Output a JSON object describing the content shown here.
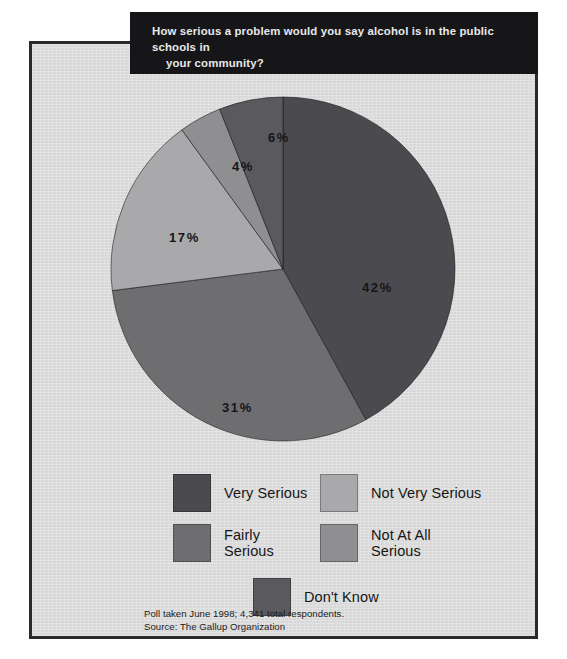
{
  "title": {
    "line1": "How serious a problem would you say alcohol is in the public schools in",
    "line2": "your community?",
    "full": "How serious a problem would you say alcohol is in the public schools in your community?"
  },
  "footnote": {
    "line1": "Poll taken June 1998; 4,341 total respondents.",
    "line2": "Source: The Gallup Organization"
  },
  "legend": [
    {
      "label": "Very Serious",
      "color": "#4b4b4f"
    },
    {
      "label": "Fairly\nSerious",
      "color": "#6e6e71"
    },
    {
      "label": "Not Very Serious",
      "color": "#a9a9ac"
    },
    {
      "label": "Not At All\nSerious",
      "color": "#8f8f92"
    },
    {
      "label": "Don't Know",
      "color": "#5a5a5e"
    }
  ],
  "chart_data": {
    "type": "pie",
    "labels": [
      "Very Serious",
      "Fairly Serious",
      "Not Very Serious",
      "Not At All Serious",
      "Don't Know"
    ],
    "values": [
      42,
      31,
      17,
      4,
      6
    ],
    "value_labels": [
      "42%",
      "31%",
      "17%",
      "4%",
      "6%"
    ],
    "unit": "percent",
    "total": 100,
    "colors": [
      "#4b4b4f",
      "#6e6e71",
      "#a9a9ac",
      "#8f8f92",
      "#5a5a5e"
    ],
    "start_angle_deg": 0,
    "direction": "clockwise",
    "legend_position": "bottom",
    "grid": false,
    "source": "The Gallup Organization",
    "sample_size": "4,341 total respondents",
    "date": "June 1998"
  },
  "colors": {
    "panel_bg": "#dcdcdc",
    "panel_border": "#2a2a2c",
    "banner_bg": "#161618",
    "banner_text": "#e9e9e9",
    "label_text": "#151515"
  }
}
